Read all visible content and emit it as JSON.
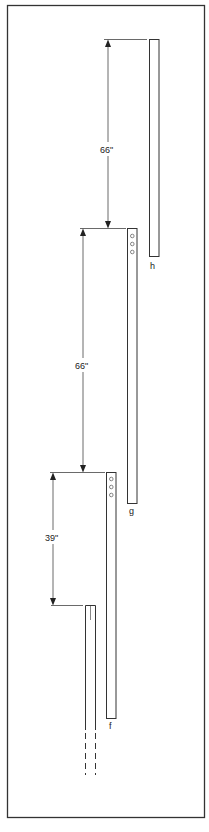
{
  "diagram": {
    "type": "antenna-element-spacing",
    "frame": {
      "stroke": "#333333",
      "background": "#ffffff"
    },
    "elements": [
      {
        "id": "h",
        "label": "h",
        "holes": 0
      },
      {
        "id": "g",
        "label": "g",
        "holes": 3
      },
      {
        "id": "f",
        "label": "f",
        "holes": 3
      },
      {
        "id": "mast",
        "label": "",
        "continues": true
      }
    ],
    "dimensions": [
      {
        "label": "66\"",
        "from": "g",
        "to": "h"
      },
      {
        "label": "66\"",
        "from": "f",
        "to": "g"
      },
      {
        "label": "39\"",
        "from": "mast",
        "to": "f"
      }
    ]
  }
}
